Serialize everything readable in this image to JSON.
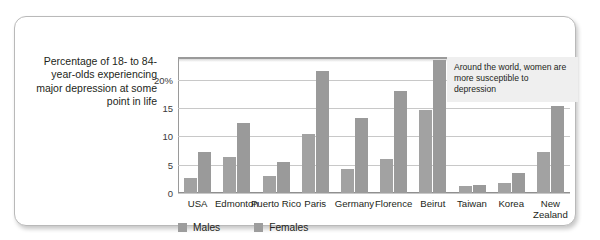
{
  "caption": "Percentage of 18- to 84-year-olds experiencing major depression at some point in life",
  "annotation": "Around the world, women are more susceptible to depression",
  "legend": {
    "males": "Males",
    "females": "Females"
  },
  "colors": {
    "males": "#a2a2a2",
    "females": "#9a9a9a",
    "grid": "#c8c8c8",
    "frame": "#b9b9b9",
    "annotation_bg": "#efefef"
  },
  "chart_data": {
    "type": "bar",
    "title": "",
    "xlabel": "",
    "ylabel": "Percentage of 18- to 84-year-olds experiencing major depression at some point in life",
    "ylim": [
      0,
      24
    ],
    "yticks": [
      "0",
      "5",
      "10",
      "15",
      "20%"
    ],
    "ytick_values": [
      0,
      5,
      10,
      15,
      20
    ],
    "grid": true,
    "legend_position": "bottom-left",
    "categories": [
      "USA",
      "Edmonton",
      "Puerto Rico",
      "Paris",
      "Germany",
      "Florence",
      "Beirut",
      "Taiwan",
      "Korea",
      "New Zealand"
    ],
    "series": [
      {
        "name": "Males",
        "values": [
          2.6,
          6.3,
          3.0,
          10.5,
          4.3,
          6.0,
          14.7,
          1.2,
          1.8,
          7.3
        ]
      },
      {
        "name": "Females",
        "values": [
          7.2,
          12.3,
          5.4,
          21.5,
          13.3,
          18.0,
          23.5,
          1.5,
          3.5,
          15.3
        ]
      }
    ],
    "annotations": [
      "Around the world, women are more susceptible to depression"
    ]
  }
}
